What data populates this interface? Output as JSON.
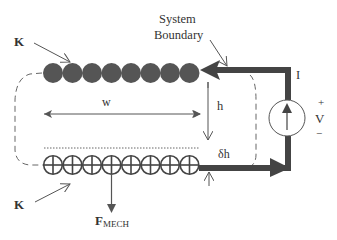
{
  "labels": {
    "k_top": "K",
    "k_bottom": "K",
    "system_boundary_line1": "System",
    "system_boundary_line2": "Boundary",
    "current": "I",
    "width": "w",
    "height": "h",
    "delta_h": "δh",
    "voltage": "V",
    "plus": "+",
    "minus": "−",
    "force_main": "F",
    "force_sub": "MECH"
  },
  "conductors": {
    "top_row": {
      "count": 8,
      "style": "filled",
      "fill": "#555555"
    },
    "bottom_row": {
      "count": 8,
      "style": "cross",
      "stroke": "#444444"
    }
  },
  "colors": {
    "wire": "#444444",
    "stroke": "#555555",
    "text": "#333333",
    "background": "#ffffff"
  }
}
